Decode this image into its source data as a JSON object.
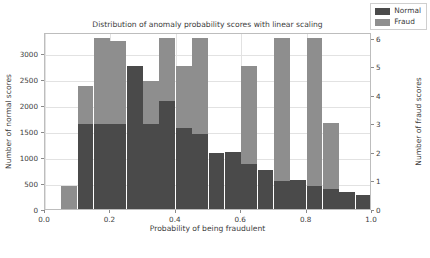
{
  "chart_data": {
    "type": "bar",
    "title": "Distribution of anomaly probability scores with linear scaling",
    "xlabel": "Probability of being fraudulent",
    "ylabel": "Number of normal scores",
    "ylabel_right": "Number of fraud scores",
    "grid": true,
    "legend_position": "upper right",
    "xlim": [
      0.0,
      1.0
    ],
    "ylim": [
      0,
      3400
    ],
    "ylim_right": [
      0,
      6.2
    ],
    "xticks": [
      "0.0",
      "0.2",
      "0.4",
      "0.6",
      "0.8",
      "1.0"
    ],
    "xtick_values": [
      0.0,
      0.2,
      0.4,
      0.6,
      0.8,
      1.0
    ],
    "yticks": [
      "0",
      "500",
      "1000",
      "1500",
      "2000",
      "2500",
      "3000"
    ],
    "ytick_values": [
      0,
      500,
      1000,
      1500,
      2000,
      2500,
      3000
    ],
    "yticks_right": [
      "0",
      "1",
      "2",
      "3",
      "4",
      "5",
      "6"
    ],
    "ytick_values_right": [
      0,
      1,
      2,
      3,
      4,
      5,
      6
    ],
    "bin_width": 0.05,
    "bin_centers": [
      0.075,
      0.125,
      0.175,
      0.225,
      0.275,
      0.325,
      0.375,
      0.425,
      0.475,
      0.525,
      0.575,
      0.625,
      0.675,
      0.725,
      0.775,
      0.825,
      0.875,
      0.925,
      0.975
    ],
    "bin_left_edges": [
      0.05,
      0.1,
      0.15,
      0.2,
      0.25,
      0.3,
      0.35,
      0.4,
      0.45,
      0.5,
      0.55,
      0.6,
      0.65,
      0.7,
      0.75,
      0.8,
      0.85,
      0.9,
      0.95
    ],
    "series": [
      {
        "name": "Normal",
        "axis": "left",
        "color": "#4a4a4a",
        "values": [
          0,
          1630,
          1630,
          1630,
          2740,
          1630,
          2080,
          1560,
          1440,
          1080,
          1100,
          860,
          750,
          530,
          560,
          450,
          380,
          330,
          260
        ]
      },
      {
        "name": "Fraud",
        "axis": "right",
        "color": "#8e8e8e",
        "values": [
          0.8,
          4.3,
          6.0,
          5.9,
          0,
          4.5,
          6.0,
          5.0,
          6.0,
          0,
          0,
          5.0,
          0,
          6.0,
          0,
          6.0,
          3.0,
          0,
          0
        ]
      }
    ]
  },
  "legend": {
    "entries": [
      {
        "label": "Normal",
        "color": "#4a4a4a"
      },
      {
        "label": "Fraud",
        "color": "#8e8e8e"
      }
    ]
  }
}
